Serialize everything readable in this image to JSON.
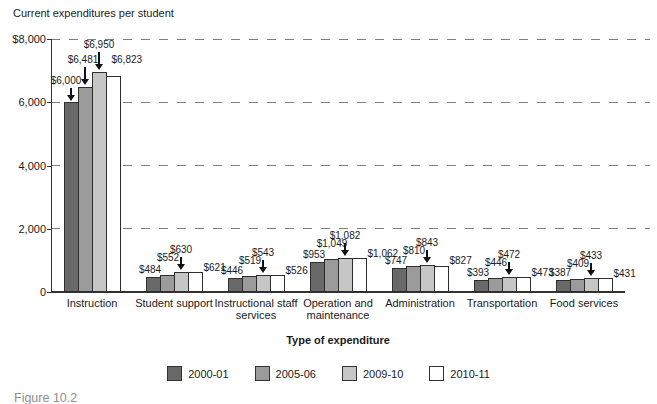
{
  "figure_label": "Figure 10.2",
  "chart_data": {
    "type": "bar",
    "title": "Current expenditures per student",
    "xlabel": "Type of expenditure",
    "ylabel": "Current expenditures per student",
    "ylim": [
      0,
      8000
    ],
    "yticks": [
      8000,
      6000,
      4000,
      2000,
      0
    ],
    "ytick_labels": [
      "$8,000",
      "6,000",
      "4,000",
      "2,000",
      "0"
    ],
    "grid": "horizontal-dashed",
    "legend_position": "bottom",
    "categories": [
      {
        "label_lines": [
          "Instruction"
        ]
      },
      {
        "label_lines": [
          "Student support"
        ]
      },
      {
        "label_lines": [
          "Instructional staff",
          "services"
        ]
      },
      {
        "label_lines": [
          "Operation and",
          "maintenance"
        ]
      },
      {
        "label_lines": [
          "Administration"
        ]
      },
      {
        "label_lines": [
          "Transportation"
        ]
      },
      {
        "label_lines": [
          "Food services"
        ]
      }
    ],
    "series": [
      {
        "name": "2000-01",
        "color": "#696969",
        "values": [
          6000,
          484,
          446,
          953,
          747,
          393,
          387
        ]
      },
      {
        "name": "2005-06",
        "color": "#9b9b9b",
        "values": [
          6481,
          552,
          519,
          1049,
          810,
          446,
          409
        ]
      },
      {
        "name": "2009-10",
        "color": "#c6c6c6",
        "values": [
          6950,
          630,
          543,
          1082,
          843,
          472,
          433
        ]
      },
      {
        "name": "2010-11",
        "color": "#ffffff",
        "values": [
          6823,
          621,
          526,
          1062,
          827,
          473,
          431
        ]
      }
    ],
    "data_labels": [
      [
        "$6,000",
        "$6,481",
        "$6,950",
        "$6,823"
      ],
      [
        "$484",
        "$552",
        "$630",
        "$621"
      ],
      [
        "$446",
        "$519",
        "$543",
        "$526"
      ],
      [
        "$953",
        "$1,049",
        "$1,082",
        "$1,062"
      ],
      [
        "$747",
        "$810",
        "$843",
        "$827"
      ],
      [
        "$393",
        "$446",
        "$472",
        "$473"
      ],
      [
        "$387",
        "$409",
        "$433",
        "$431"
      ]
    ]
  },
  "colors": {
    "axis": "#333333",
    "grid": "#7f7f7f",
    "text": "#1a1a1a",
    "arrow": "#111111",
    "figure_label": "#8d8d8d"
  }
}
